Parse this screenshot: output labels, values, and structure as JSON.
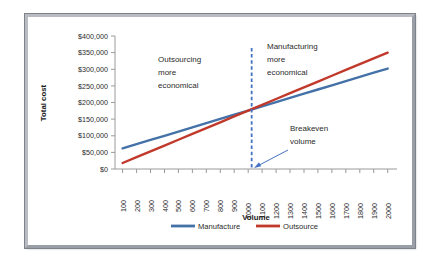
{
  "chart_data": {
    "type": "line",
    "title": "",
    "xlabel": "Volume",
    "ylabel": "Total cost",
    "xlim": [
      100,
      2000
    ],
    "ylim": [
      0,
      400000
    ],
    "grid": false,
    "legend_position": "bottom",
    "categories": [
      100,
      200,
      300,
      400,
      500,
      600,
      700,
      800,
      900,
      1000,
      1100,
      1200,
      1300,
      1400,
      1500,
      1600,
      1700,
      1800,
      1900,
      2000
    ],
    "x_tick_labels": [
      "100",
      "200",
      "300",
      "400",
      "500",
      "600",
      "700",
      "800",
      "900",
      "1000",
      "1100",
      "1200",
      "1300",
      "1400",
      "1500",
      "1600",
      "1700",
      "1800",
      "1900",
      "2000"
    ],
    "y_tick_labels": [
      "$0",
      "$50,000",
      "$100,000",
      "$150,000",
      "$200,000",
      "$250,000",
      "$300,000",
      "$350,000",
      "$400,000"
    ],
    "y_tick_values": [
      0,
      50000,
      100000,
      150000,
      200000,
      250000,
      300000,
      350000,
      400000
    ],
    "series": [
      {
        "name": "Manufacture",
        "color": "#4472A8",
        "values": [
          62000,
          74600,
          87300,
          99900,
          112600,
          125200,
          137900,
          150500,
          163200,
          175800,
          188500,
          201100,
          213800,
          226400,
          239100,
          251700,
          264400,
          277000,
          289700,
          302000
        ]
      },
      {
        "name": "Outsource",
        "color": "#C0392B",
        "values": [
          18000,
          35500,
          53000,
          70500,
          88000,
          105500,
          123000,
          140500,
          158000,
          175500,
          193000,
          210500,
          228000,
          245500,
          263000,
          280500,
          298000,
          315500,
          333000,
          350000
        ]
      }
    ],
    "annotations": [
      {
        "id": "outsourcing-note",
        "lines": [
          "Outsourcing",
          "more",
          "economical"
        ],
        "color": "#2b2b2b"
      },
      {
        "id": "manufacturing-note",
        "lines": [
          "Manufacturing",
          "more",
          "economical"
        ],
        "color": "#2b2b2b"
      },
      {
        "id": "breakeven-note",
        "lines": [
          "Breakeven",
          "volume"
        ],
        "color": "#2b2b2b"
      }
    ],
    "breakeven": {
      "label": "Breakeven volume",
      "volume": 1025,
      "cost": 180000,
      "line_color": "#4472C4",
      "line_style": "dashed"
    }
  },
  "legend": {
    "items": [
      {
        "label": "Manufacture",
        "color": "#4472A8"
      },
      {
        "label": "Outsource",
        "color": "#C0392B"
      }
    ]
  },
  "axis_titles": {
    "x": "Volume",
    "y": "Total cost"
  },
  "annotation_text": {
    "outsourcing_l1": "Outsourcing",
    "outsourcing_l2": "more",
    "outsourcing_l3": "economical",
    "manufacturing_l1": "Manufacturing",
    "manufacturing_l2": "more",
    "manufacturing_l3": "economical",
    "breakeven_l1": "Breakeven",
    "breakeven_l2": "volume"
  },
  "y_labels": {
    "t0": "$400,000",
    "t1": "$350,000",
    "t2": "$300,000",
    "t3": "$250,000",
    "t4": "$200,000",
    "t5": "$150,000",
    "t6": "$100,000",
    "t7": "$50,000",
    "t8": "$0"
  },
  "x_labels": {
    "t0": "100",
    "t1": "200",
    "t2": "300",
    "t3": "400",
    "t4": "500",
    "t5": "600",
    "t6": "700",
    "t7": "800",
    "t8": "900",
    "t9": "1000",
    "t10": "1100",
    "t11": "1200",
    "t12": "1300",
    "t13": "1400",
    "t14": "1500",
    "t15": "1600",
    "t16": "1700",
    "t17": "1800",
    "t18": "1900",
    "t19": "2000"
  },
  "colors": {
    "manufacture": "#4472A8",
    "outsource": "#C0392B",
    "breakeven": "#4472C4",
    "axis": "#9a9a9a",
    "text": "#2b2b2b",
    "frame_light": "#b9bcc2",
    "frame_dark": "#9a9ea6"
  }
}
